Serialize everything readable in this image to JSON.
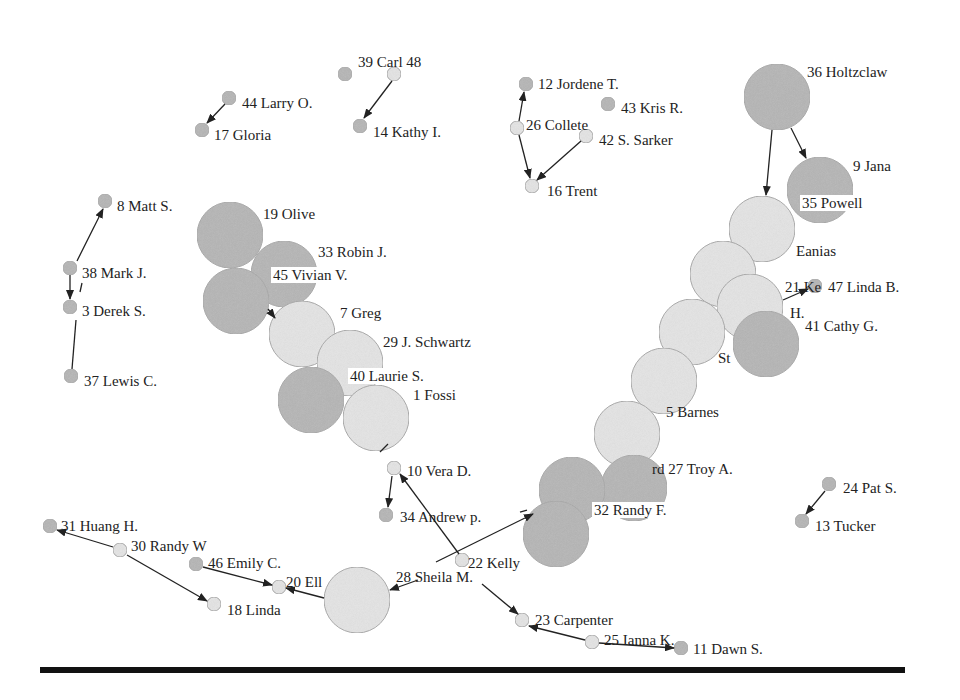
{
  "diagram": {
    "type": "directed-network",
    "colors": {
      "node_dark": "#b5b5b5",
      "node_light": "#e4e4e4",
      "node_stroke": "#a8a8a8",
      "edge": "#222222",
      "footer_bar": "#111111"
    },
    "nodes": [
      {
        "id": "n39",
        "label": "39 Carl 48",
        "x": 394,
        "y": 74,
        "r": 7,
        "shade": "light",
        "lx": 358,
        "ly": 62
      },
      {
        "id": "n48",
        "label": "",
        "x": 345,
        "y": 74,
        "r": 7,
        "shade": "dark"
      },
      {
        "id": "n14",
        "label": "14 Kathy I.",
        "x": 360,
        "y": 126,
        "r": 7,
        "shade": "dark",
        "lx": 373,
        "ly": 132
      },
      {
        "id": "n44",
        "label": "44 Larry O.",
        "x": 229,
        "y": 98,
        "r": 7,
        "shade": "dark",
        "lx": 242,
        "ly": 103
      },
      {
        "id": "n17",
        "label": "17 Gloria",
        "x": 202,
        "y": 130,
        "r": 7,
        "shade": "dark",
        "lx": 214,
        "ly": 135
      },
      {
        "id": "n12",
        "label": "12 Jordene T.",
        "x": 526,
        "y": 84,
        "r": 7,
        "shade": "dark",
        "lx": 538,
        "ly": 84
      },
      {
        "id": "n43",
        "label": "43 Kris R.",
        "x": 608,
        "y": 104,
        "r": 7,
        "shade": "dark",
        "lx": 621,
        "ly": 108
      },
      {
        "id": "n26",
        "label": "26 Collete",
        "x": 517,
        "y": 128,
        "r": 7,
        "shade": "light",
        "lx": 526,
        "ly": 125
      },
      {
        "id": "n42",
        "label": "42 S. Sarker",
        "x": 586,
        "y": 136,
        "r": 7,
        "shade": "light",
        "lx": 599,
        "ly": 140
      },
      {
        "id": "n16",
        "label": "16 Trent",
        "x": 532,
        "y": 186,
        "r": 7,
        "shade": "light",
        "lx": 547,
        "ly": 191
      },
      {
        "id": "n36",
        "label": "36 Holtzclaw",
        "x": 777,
        "y": 97,
        "r": 33,
        "shade": "dark",
        "lx": 807,
        "ly": 72
      },
      {
        "id": "n9",
        "label": "9 Jana",
        "x": 820,
        "y": 190,
        "r": 33,
        "shade": "dark",
        "lx": 853,
        "ly": 166
      },
      {
        "id": "n35",
        "label": "35 Powell",
        "x": 0,
        "y": 0,
        "r": 0,
        "shade": "none",
        "lx": 802,
        "ly": 203,
        "bg": true
      },
      {
        "id": "nEan",
        "label": "Eanias",
        "x": 762,
        "y": 229,
        "r": 33,
        "shade": "light",
        "lx": 796,
        "ly": 251
      },
      {
        "id": "nA",
        "label": "",
        "x": 723,
        "y": 274,
        "r": 33,
        "shade": "light"
      },
      {
        "id": "n21",
        "label": "21 Ke",
        "x": 750,
        "y": 307,
        "r": 33,
        "shade": "light",
        "lx": 785,
        "ly": 287
      },
      {
        "id": "nH",
        "label": "H.",
        "x": 0,
        "y": 0,
        "r": 0,
        "shade": "none",
        "lx": 790,
        "ly": 313
      },
      {
        "id": "n47",
        "label": "47 Linda B.",
        "x": 815,
        "y": 286,
        "r": 7,
        "shade": "dark",
        "lx": 828,
        "ly": 287
      },
      {
        "id": "n41",
        "label": "41 Cathy G.",
        "x": 766,
        "y": 344,
        "r": 33,
        "shade": "dark",
        "lx": 805,
        "ly": 326
      },
      {
        "id": "nSt",
        "label": "St",
        "x": 692,
        "y": 332,
        "r": 33,
        "shade": "light",
        "lx": 718,
        "ly": 358
      },
      {
        "id": "n5",
        "label": "5 Barnes",
        "x": 664,
        "y": 381,
        "r": 33,
        "shade": "light",
        "lx": 666,
        "ly": 412
      },
      {
        "id": "nB",
        "label": "",
        "x": 627,
        "y": 434,
        "r": 33,
        "shade": "light"
      },
      {
        "id": "n27",
        "label": "rd 27 Troy A.",
        "x": 634,
        "y": 488,
        "r": 33,
        "shade": "dark",
        "lx": 652,
        "ly": 469
      },
      {
        "id": "nC",
        "label": "",
        "x": 572,
        "y": 490,
        "r": 33,
        "shade": "dark"
      },
      {
        "id": "n32",
        "label": "32 Randy F.",
        "x": 556,
        "y": 534,
        "r": 33,
        "shade": "dark",
        "lx": 594,
        "ly": 510,
        "bg": true
      },
      {
        "id": "n19",
        "label": "19 Olive",
        "x": 230,
        "y": 235,
        "r": 33,
        "shade": "dark",
        "lx": 263,
        "ly": 214
      },
      {
        "id": "n33",
        "label": "33 Robin J.",
        "x": 284,
        "y": 274,
        "r": 33,
        "shade": "dark",
        "lx": 318,
        "ly": 252
      },
      {
        "id": "n45",
        "label": "45 Vivian V.",
        "x": 236,
        "y": 301,
        "r": 33,
        "shade": "dark",
        "lx": 273,
        "ly": 275,
        "bg": true
      },
      {
        "id": "n7",
        "label": "7 Greg",
        "x": 302,
        "y": 334,
        "r": 33,
        "shade": "light",
        "lx": 340,
        "ly": 313
      },
      {
        "id": "n29",
        "label": "29 J. Schwartz",
        "x": 350,
        "y": 363,
        "r": 33,
        "shade": "light",
        "lx": 383,
        "ly": 342
      },
      {
        "id": "nD",
        "label": "",
        "x": 311,
        "y": 400,
        "r": 33,
        "shade": "dark"
      },
      {
        "id": "n40",
        "label": "40 Laurie S.",
        "x": 0,
        "y": 0,
        "r": 0,
        "shade": "none",
        "lx": 350,
        "ly": 376,
        "bg": true
      },
      {
        "id": "n1",
        "label": "1 Fossi",
        "x": 376,
        "y": 418,
        "r": 33,
        "shade": "light",
        "lx": 413,
        "ly": 395
      },
      {
        "id": "n10",
        "label": "10 Vera D.",
        "x": 394,
        "y": 468,
        "r": 7,
        "shade": "light",
        "lx": 407,
        "ly": 471
      },
      {
        "id": "n34",
        "label": "34 Andrew p.",
        "x": 386,
        "y": 515,
        "r": 7,
        "shade": "dark",
        "lx": 400,
        "ly": 517
      },
      {
        "id": "n22",
        "label": "22 Kelly",
        "x": 462,
        "y": 560,
        "r": 7,
        "shade": "light",
        "lx": 468,
        "ly": 563
      },
      {
        "id": "n28",
        "label": "28 Sheila M.",
        "x": 0,
        "y": 0,
        "r": 0,
        "shade": "none",
        "lx": 396,
        "ly": 577
      },
      {
        "id": "nE",
        "label": "",
        "x": 357,
        "y": 600,
        "r": 33,
        "shade": "light"
      },
      {
        "id": "n20",
        "label": "20 Ell",
        "x": 279,
        "y": 587,
        "r": 7,
        "shade": "light",
        "lx": 286,
        "ly": 582
      },
      {
        "id": "n46",
        "label": "46 Emily C.",
        "x": 196,
        "y": 564,
        "r": 7,
        "shade": "dark",
        "lx": 208,
        "ly": 563
      },
      {
        "id": "n18",
        "label": "18 Linda",
        "x": 214,
        "y": 604,
        "r": 7,
        "shade": "light",
        "lx": 227,
        "ly": 610
      },
      {
        "id": "n30",
        "label": "30 Randy W",
        "x": 120,
        "y": 550,
        "r": 7,
        "shade": "light",
        "lx": 131,
        "ly": 546
      },
      {
        "id": "n31",
        "label": "31 Huang H.",
        "x": 50,
        "y": 526,
        "r": 7,
        "shade": "dark",
        "lx": 61,
        "ly": 526
      },
      {
        "id": "n23",
        "label": "23 Carpenter",
        "x": 522,
        "y": 620,
        "r": 7,
        "shade": "light",
        "lx": 535,
        "ly": 620
      },
      {
        "id": "n25",
        "label": "25 Ianna K.",
        "x": 592,
        "y": 642,
        "r": 7,
        "shade": "light",
        "lx": 604,
        "ly": 640
      },
      {
        "id": "n11",
        "label": "11 Dawn S.",
        "x": 681,
        "y": 648,
        "r": 7,
        "shade": "dark",
        "lx": 693,
        "ly": 649
      },
      {
        "id": "n24",
        "label": "24 Pat S.",
        "x": 829,
        "y": 484,
        "r": 7,
        "shade": "dark",
        "lx": 843,
        "ly": 488
      },
      {
        "id": "n13",
        "label": "13 Tucker",
        "x": 802,
        "y": 521,
        "r": 7,
        "shade": "dark",
        "lx": 815,
        "ly": 526
      },
      {
        "id": "n8",
        "label": "8 Matt S.",
        "x": 105,
        "y": 201,
        "r": 7,
        "shade": "dark",
        "lx": 117,
        "ly": 206
      },
      {
        "id": "n38",
        "label": "38 Mark J.",
        "x": 70,
        "y": 268,
        "r": 7,
        "shade": "dark",
        "lx": 82,
        "ly": 273
      },
      {
        "id": "n3",
        "label": "3 Derek S.",
        "x": 70,
        "y": 307,
        "r": 7,
        "shade": "dark",
        "lx": 82,
        "ly": 311
      },
      {
        "id": "n37",
        "label": "37 Lewis C.",
        "x": 71,
        "y": 376,
        "r": 7,
        "shade": "dark",
        "lx": 84,
        "ly": 381
      }
    ],
    "edges": [
      {
        "from": [
          392,
          81
        ],
        "to": [
          364,
          118
        ],
        "arrow": true
      },
      {
        "from": [
          225,
          104
        ],
        "to": [
          207,
          123
        ],
        "arrow": true
      },
      {
        "from": [
          519,
          121
        ],
        "to": [
          524,
          92
        ],
        "arrow": true
      },
      {
        "from": [
          519,
          135
        ],
        "to": [
          530,
          178
        ],
        "arrow": true
      },
      {
        "from": [
          581,
          141
        ],
        "to": [
          537,
          180
        ],
        "arrow": true
      },
      {
        "from": [
          772,
          130
        ],
        "to": [
          766,
          195
        ],
        "arrow": true
      },
      {
        "from": [
          791,
          128
        ],
        "to": [
          806,
          158
        ],
        "arrow": true
      },
      {
        "from": [
          783,
          300
        ],
        "to": [
          808,
          289
        ],
        "arrow": true
      },
      {
        "from": [
          77,
          261
        ],
        "to": [
          103,
          209
        ],
        "arrow": true
      },
      {
        "from": [
          70,
          275
        ],
        "to": [
          70,
          299
        ],
        "arrow": true
      },
      {
        "from": [
          82,
          283
        ],
        "to": [
          80,
          292
        ],
        "arrow": false
      },
      {
        "from": [
          76,
          320
        ],
        "to": [
          72,
          369
        ],
        "arrow": false
      },
      {
        "from": [
          268,
          309
        ],
        "to": [
          275,
          318
        ],
        "arrow": true
      },
      {
        "from": [
          388,
          444
        ],
        "to": [
          380,
          452
        ],
        "arrow": false
      },
      {
        "from": [
          392,
          476
        ],
        "to": [
          388,
          507
        ],
        "arrow": true
      },
      {
        "from": [
          459,
          554
        ],
        "to": [
          400,
          474
        ],
        "arrow": true
      },
      {
        "from": [
          436,
          562
        ],
        "to": [
          533,
          514
        ],
        "arrow": true
      },
      {
        "from": [
          418,
          580
        ],
        "to": [
          390,
          590
        ],
        "arrow": true
      },
      {
        "from": [
          482,
          584
        ],
        "to": [
          518,
          614
        ],
        "arrow": true
      },
      {
        "from": [
          324,
          598
        ],
        "to": [
          286,
          588
        ],
        "arrow": true
      },
      {
        "from": [
          203,
          567
        ],
        "to": [
          272,
          585
        ],
        "arrow": true
      },
      {
        "from": [
          113,
          547
        ],
        "to": [
          57,
          530
        ],
        "arrow": true
      },
      {
        "from": [
          127,
          555
        ],
        "to": [
          207,
          601
        ],
        "arrow": true
      },
      {
        "from": [
          585,
          640
        ],
        "to": [
          529,
          626
        ],
        "arrow": true
      },
      {
        "from": [
          599,
          643
        ],
        "to": [
          674,
          648
        ],
        "arrow": true
      },
      {
        "from": [
          825,
          491
        ],
        "to": [
          806,
          514
        ],
        "arrow": true
      },
      {
        "from": [
          520,
          512
        ],
        "to": [
          527,
          510
        ],
        "arrow": false
      }
    ]
  },
  "footer": {
    "bar": {
      "x": 40,
      "y": 667,
      "width": 865,
      "height": 6
    }
  }
}
